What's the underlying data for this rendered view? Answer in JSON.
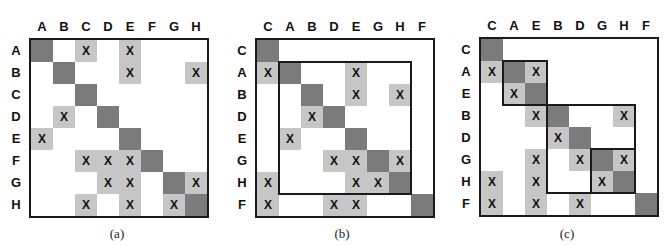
{
  "figure": {
    "cell_size": 22,
    "colors": {
      "diagonal": "#7b7b7b",
      "mark": "#c6c6c6",
      "border": "#1a1a1a"
    },
    "mark_symbol": "X",
    "panels": [
      {
        "id": "a",
        "caption": "(a)",
        "origin": [
          29,
          38
        ],
        "caption_pos": [
          97,
          226
        ],
        "order": [
          "A",
          "B",
          "C",
          "D",
          "E",
          "F",
          "G",
          "H"
        ],
        "marks": [
          [
            0,
            2
          ],
          [
            0,
            4
          ],
          [
            1,
            4
          ],
          [
            1,
            7
          ],
          [
            3,
            1
          ],
          [
            4,
            0
          ],
          [
            5,
            2
          ],
          [
            5,
            3
          ],
          [
            5,
            4
          ],
          [
            6,
            3
          ],
          [
            6,
            4
          ],
          [
            6,
            7
          ],
          [
            7,
            2
          ],
          [
            7,
            4
          ],
          [
            7,
            6
          ]
        ],
        "boxes": []
      },
      {
        "id": "b",
        "caption": "(b)",
        "origin": [
          255,
          38
        ],
        "caption_pos": [
          322,
          226
        ],
        "order": [
          "C",
          "A",
          "B",
          "D",
          "E",
          "G",
          "H",
          "F"
        ],
        "marks": [
          [
            1,
            0
          ],
          [
            1,
            4
          ],
          [
            2,
            4
          ],
          [
            2,
            6
          ],
          [
            3,
            2
          ],
          [
            4,
            1
          ],
          [
            5,
            3
          ],
          [
            5,
            4
          ],
          [
            5,
            6
          ],
          [
            6,
            0
          ],
          [
            6,
            4
          ],
          [
            6,
            5
          ],
          [
            7,
            0
          ],
          [
            7,
            3
          ],
          [
            7,
            4
          ]
        ],
        "boxes": [
          [
            1,
            6
          ]
        ]
      },
      {
        "id": "c",
        "caption": "(c)",
        "origin": [
          479,
          37
        ],
        "caption_pos": [
          547,
          226
        ],
        "order": [
          "C",
          "A",
          "E",
          "B",
          "D",
          "G",
          "H",
          "F"
        ],
        "marks": [
          [
            1,
            0
          ],
          [
            1,
            2
          ],
          [
            2,
            1
          ],
          [
            3,
            2
          ],
          [
            3,
            6
          ],
          [
            4,
            3
          ],
          [
            5,
            2
          ],
          [
            5,
            4
          ],
          [
            5,
            6
          ],
          [
            6,
            0
          ],
          [
            6,
            2
          ],
          [
            6,
            5
          ],
          [
            7,
            0
          ],
          [
            7,
            2
          ],
          [
            7,
            4
          ]
        ],
        "boxes": [
          [
            1,
            2
          ],
          [
            3,
            6
          ],
          [
            5,
            6
          ]
        ]
      }
    ]
  }
}
